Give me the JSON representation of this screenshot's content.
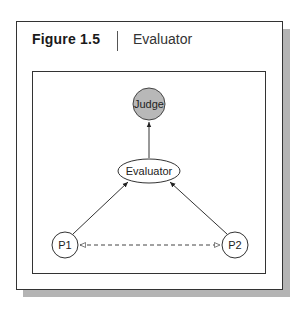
{
  "figure": {
    "label": "Figure 1.5",
    "title": "Evaluator"
  },
  "diagram": {
    "nodes": [
      {
        "id": "judge",
        "label": "Judge",
        "shape": "circle",
        "fill": "#b8b8b8"
      },
      {
        "id": "evaluator",
        "label": "Evaluator",
        "shape": "ellipse",
        "fill": "#ffffff"
      },
      {
        "id": "p1",
        "label": "P1",
        "shape": "circle",
        "fill": "#ffffff"
      },
      {
        "id": "p2",
        "label": "P2",
        "shape": "circle",
        "fill": "#ffffff"
      }
    ],
    "edges": [
      {
        "from": "evaluator",
        "to": "judge",
        "style": "solid",
        "arrow": "end"
      },
      {
        "from": "p1",
        "to": "evaluator",
        "style": "solid",
        "arrow": "end"
      },
      {
        "from": "p2",
        "to": "evaluator",
        "style": "solid",
        "arrow": "end"
      },
      {
        "from": "p1",
        "to": "p2",
        "style": "dashed",
        "arrow": "both-hollow"
      }
    ]
  },
  "colors": {
    "shadow": "#b4b4b4",
    "border": "#333333",
    "judge_fill": "#b8b8b8"
  }
}
